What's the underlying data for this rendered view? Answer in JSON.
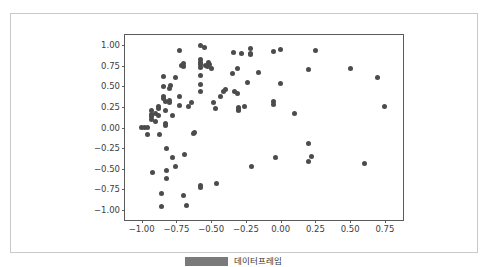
{
  "figure": {
    "background_color": "#ffffff",
    "card_border_color": "#c9c9c9",
    "axes_edge_color": "#5b5b5b"
  },
  "legend_strip": {
    "swatch_color": "#7a7a7a",
    "caption": "데이터프레임"
  },
  "chart_data": {
    "type": "scatter",
    "title": "",
    "xlabel": "",
    "ylabel": "",
    "xlim": [
      -1.12,
      0.88
    ],
    "ylim": [
      -1.12,
      1.12
    ],
    "grid": false,
    "legend_position": "none",
    "marker_color": "#4c4c4c",
    "marker_size": 5,
    "xticks": [
      -1.0,
      -0.75,
      -0.5,
      -0.25,
      0.0,
      0.25,
      0.5,
      0.75
    ],
    "xticklabels": [
      "-1.00",
      "-0.75",
      "-0.50",
      "-0.25",
      "0.00",
      "0.25",
      "0.50",
      "0.75"
    ],
    "yticks": [
      1.0,
      0.75,
      0.5,
      0.25,
      0.0,
      -0.25,
      -0.5,
      -0.75,
      -1.0
    ],
    "yticklabels": [
      "1.00",
      "0.75",
      "0.50",
      "0.25",
      "0.00",
      "-0.25",
      "-0.50",
      "-0.75",
      "-1.00"
    ],
    "points": [
      [
        -1.0,
        0.0
      ],
      [
        -0.98,
        0.0
      ],
      [
        -0.96,
        0.0
      ],
      [
        -0.96,
        -0.08
      ],
      [
        -0.93,
        0.21
      ],
      [
        -0.93,
        0.16
      ],
      [
        -0.93,
        0.13
      ],
      [
        -0.93,
        0.1
      ],
      [
        -0.92,
        -0.55
      ],
      [
        -0.9,
        0.17
      ],
      [
        -0.9,
        0.07
      ],
      [
        -0.88,
        0.26
      ],
      [
        -0.88,
        0.23
      ],
      [
        -0.88,
        0.15
      ],
      [
        -0.87,
        -0.09
      ],
      [
        -0.86,
        -0.8
      ],
      [
        -0.86,
        -0.96
      ],
      [
        -0.84,
        0.62
      ],
      [
        -0.84,
        0.5
      ],
      [
        -0.84,
        0.38
      ],
      [
        -0.84,
        0.35
      ],
      [
        -0.83,
        0.32
      ],
      [
        -0.83,
        0.21
      ],
      [
        -0.83,
        0.05
      ],
      [
        -0.83,
        0.02
      ],
      [
        -0.82,
        -0.26
      ],
      [
        -0.82,
        -0.52
      ],
      [
        -0.82,
        -0.62
      ],
      [
        -0.8,
        0.47
      ],
      [
        -0.8,
        0.3
      ],
      [
        -0.8,
        0.33
      ],
      [
        -0.79,
        0.51
      ],
      [
        -0.78,
        0.14
      ],
      [
        -0.78,
        -0.36
      ],
      [
        -0.76,
        0.6
      ],
      [
        -0.76,
        -0.47
      ],
      [
        -0.73,
        0.93
      ],
      [
        -0.73,
        0.37
      ],
      [
        -0.73,
        0.27
      ],
      [
        -0.71,
        0.75
      ],
      [
        -0.7,
        0.78
      ],
      [
        -0.7,
        0.74
      ],
      [
        -0.7,
        -0.82
      ],
      [
        -0.69,
        -0.33
      ],
      [
        -0.68,
        -0.94
      ],
      [
        -0.66,
        0.26
      ],
      [
        -0.64,
        0.3
      ],
      [
        -0.63,
        -0.07
      ],
      [
        -0.62,
        -0.06
      ],
      [
        -0.58,
        0.99
      ],
      [
        -0.58,
        0.82
      ],
      [
        -0.58,
        0.79
      ],
      [
        -0.58,
        0.76
      ],
      [
        -0.58,
        0.73
      ],
      [
        -0.58,
        0.63
      ],
      [
        -0.58,
        0.52
      ],
      [
        -0.58,
        0.44
      ],
      [
        -0.58,
        -0.7
      ],
      [
        -0.58,
        -0.73
      ],
      [
        -0.55,
        0.97
      ],
      [
        -0.54,
        0.75
      ],
      [
        -0.53,
        0.74
      ],
      [
        -0.52,
        0.79
      ],
      [
        -0.51,
        0.76
      ],
      [
        -0.5,
        0.72
      ],
      [
        -0.48,
        0.3
      ],
      [
        -0.47,
        0.23
      ],
      [
        -0.46,
        -0.68
      ],
      [
        -0.43,
        0.38
      ],
      [
        -0.41,
        0.44
      ],
      [
        -0.4,
        0.46
      ],
      [
        -0.35,
        0.65
      ],
      [
        -0.34,
        0.91
      ],
      [
        -0.33,
        0.44
      ],
      [
        -0.31,
        0.41
      ],
      [
        -0.31,
        0.72
      ],
      [
        -0.3,
        0.24
      ],
      [
        -0.3,
        0.2
      ],
      [
        -0.3,
        0.22
      ],
      [
        -0.28,
        0.89
      ],
      [
        -0.26,
        0.25
      ],
      [
        -0.24,
        0.54
      ],
      [
        -0.22,
        0.96
      ],
      [
        -0.22,
        0.9
      ],
      [
        -0.22,
        0.88
      ],
      [
        -0.21,
        -0.47
      ],
      [
        -0.16,
        0.67
      ],
      [
        -0.05,
        0.92
      ],
      [
        -0.05,
        0.31
      ],
      [
        -0.05,
        0.28
      ],
      [
        -0.04,
        -0.36
      ],
      [
        0.0,
        0.95
      ],
      [
        0.0,
        0.53
      ],
      [
        0.1,
        0.17
      ],
      [
        0.2,
        0.7
      ],
      [
        0.2,
        -0.19
      ],
      [
        0.2,
        -0.41
      ],
      [
        0.22,
        -0.35
      ],
      [
        0.25,
        0.93
      ],
      [
        0.5,
        0.72
      ],
      [
        0.6,
        -0.44
      ],
      [
        0.7,
        0.61
      ],
      [
        0.75,
        0.25
      ]
    ]
  }
}
